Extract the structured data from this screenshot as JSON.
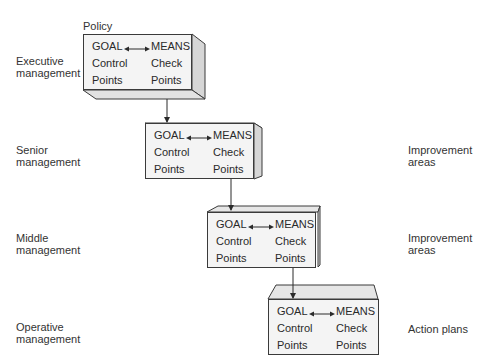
{
  "diagram": {
    "policy_label": "Policy",
    "levels": [
      {
        "left_label": "Executive\nmanagement",
        "right_label": "",
        "box": {
          "goal": "GOAL",
          "means": "MEANS",
          "control": "Control",
          "check": "Check",
          "points_left": "Points",
          "points_right": "Points"
        }
      },
      {
        "left_label": "Senior\nmanagement",
        "right_label": "Improvement\nareas",
        "box": {
          "goal": "GOAL",
          "means": "MEANS",
          "control": "Control",
          "check": "Check",
          "points_left": "Points",
          "points_right": "Points"
        }
      },
      {
        "left_label": "Middle\nmanagement",
        "right_label": "Improvement\nareas",
        "box": {
          "goal": "GOAL",
          "means": "MEANS",
          "control": "Control",
          "check": "Check",
          "points_left": "Points",
          "points_right": "Points"
        }
      },
      {
        "left_label": "Operative\nmanagement",
        "right_label": "Action plans",
        "box": {
          "goal": "GOAL",
          "means": "MEANS",
          "control": "Control",
          "check": "Check",
          "points_left": "Points",
          "points_right": "Points"
        }
      }
    ],
    "colors": {
      "front_face": "#f4f4f4",
      "side_face": "#d6d6d6",
      "top_face": "#e6e6e6",
      "stroke": "#3a3a3a"
    }
  }
}
